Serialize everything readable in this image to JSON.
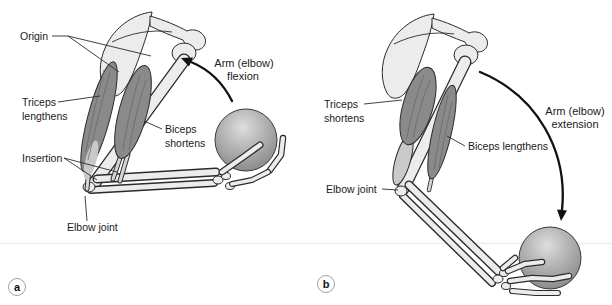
{
  "panel_a": {
    "badge": "a",
    "motion": {
      "line1": "Arm (elbow)",
      "line2": "flexion"
    },
    "labels": {
      "origin": "Origin",
      "triceps": {
        "line1": "Triceps",
        "line2": "lengthens"
      },
      "biceps": {
        "line1": "Biceps",
        "line2": "shortens"
      },
      "insertion": "Insertion",
      "elbow_joint": "Elbow joint"
    }
  },
  "panel_b": {
    "badge": "b",
    "motion": {
      "line1": "Arm (elbow)",
      "line2": "extension"
    },
    "labels": {
      "triceps": {
        "line1": "Triceps",
        "line2": "shortens"
      },
      "biceps": "Biceps lengthens",
      "elbow_joint": "Elbow joint"
    }
  },
  "colors": {
    "background": "#ffffff",
    "bone": "#ececec",
    "muscle": "#8a8a8a",
    "tendon": "#c9c9c9",
    "outline": "#2b2b2b",
    "ball_highlight": "#dedede",
    "ball_base": "#8a8a8a",
    "label_text": "#1a1a1a"
  }
}
